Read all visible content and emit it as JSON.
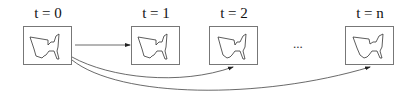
{
  "diagram": {
    "frames": [
      {
        "label": "t = 0",
        "x": 23,
        "y": 26
      },
      {
        "label": "t = 1",
        "x": 131,
        "y": 26
      },
      {
        "label": "t = 2",
        "x": 209,
        "y": 26
      },
      {
        "label": "t = n",
        "x": 345,
        "y": 26
      }
    ],
    "ellipsis": "...",
    "edges": [
      {
        "from": "t = 0",
        "to": "t = 1",
        "style": "straight-arrow"
      },
      {
        "from": "t = 0",
        "to": "t = 2",
        "style": "curved-arrow"
      },
      {
        "from": "t = 0",
        "to": "t = n",
        "style": "curved-arrow"
      }
    ],
    "frame_content_icon": "cat-silhouette-outline",
    "colors": {
      "line": "#333333",
      "frame_border": "#777777"
    }
  }
}
